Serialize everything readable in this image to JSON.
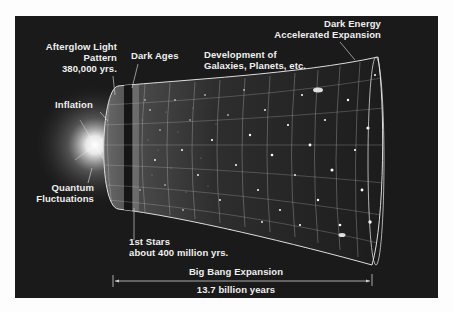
{
  "diagram": {
    "labels": {
      "afterglow": [
        "Afterglow Light",
        "Pattern",
        "380,000 yrs."
      ],
      "dark_ages": "Dark Ages",
      "development": [
        "Development of",
        "Galaxies, Planets, etc."
      ],
      "dark_energy": [
        "Dark Energy",
        "Accelerated Expansion"
      ],
      "inflation": "Inflation",
      "quantum": [
        "Quantum",
        "Fluctuations"
      ],
      "first_stars": [
        "1st Stars",
        "about 400 million yrs."
      ],
      "expansion": "Big Bang Expansion",
      "duration": "13.7 billion years"
    },
    "colors": {
      "background": "#1a1a1a",
      "text": "#f0f0f0",
      "grid": "#c8c8c8",
      "page": "#fdfdfd"
    }
  }
}
